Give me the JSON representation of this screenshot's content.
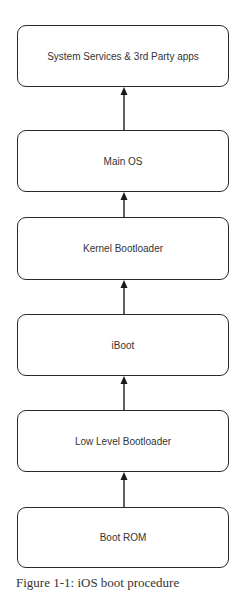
{
  "diagram": {
    "boxes": [
      {
        "label": "System Services & 3rd Party apps"
      },
      {
        "label": "Main OS"
      },
      {
        "label": "Kernel Bootloader"
      },
      {
        "label": "iBoot"
      },
      {
        "label": "Low Level Bootloader"
      },
      {
        "label": "Boot ROM"
      }
    ],
    "edges": [
      {
        "from": "Boot ROM",
        "to": "Low Level Bootloader"
      },
      {
        "from": "Low Level Bootloader",
        "to": "iBoot"
      },
      {
        "from": "iBoot",
        "to": "Kernel Bootloader"
      },
      {
        "from": "Kernel Bootloader",
        "to": "Main OS"
      },
      {
        "from": "Main OS",
        "to": "System Services & 3rd Party apps"
      }
    ],
    "caption": "Figure 1-1: iOS boot procedure",
    "colors": {
      "border": "#2a2a2a",
      "text": "#333333",
      "background": "#ffffff"
    }
  }
}
